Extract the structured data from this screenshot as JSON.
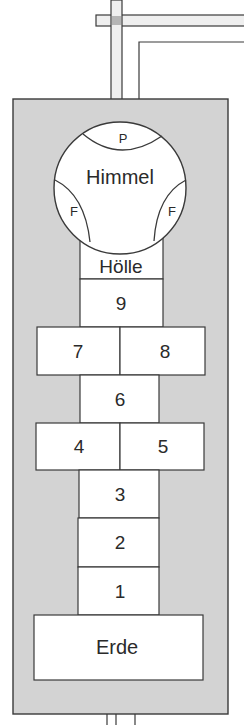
{
  "diagram": {
    "colors": {
      "ground": "#d3d3d3",
      "line": "#3a3a3a",
      "field": "#ffffff",
      "pipe_fill": "#efefef",
      "pipe_joint": "#b5b5b5"
    },
    "heaven": {
      "label": "Himmel",
      "top_segment": "P",
      "left_segment": "F",
      "right_segment": "F"
    },
    "hell": {
      "label": "Hölle"
    },
    "fields": {
      "f9": "9",
      "f8": "8",
      "f7": "7",
      "f6": "6",
      "f5": "5",
      "f4": "4",
      "f3": "3",
      "f2": "2",
      "f1": "1"
    },
    "earth": {
      "label": "Erde"
    }
  }
}
